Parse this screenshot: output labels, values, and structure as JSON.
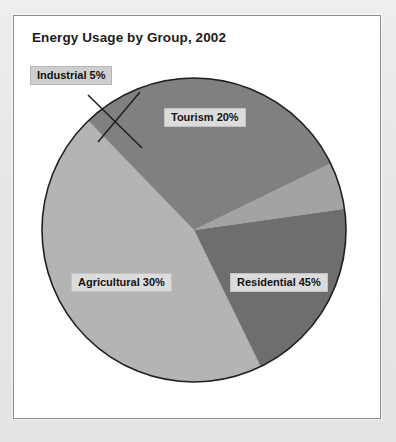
{
  "chart_data": {
    "type": "pie",
    "title": "Energy Usage by Group, 2002",
    "categories": [
      "Tourism",
      "Residential",
      "Agricultural",
      "Industrial"
    ],
    "values": [
      20,
      45,
      30,
      5
    ],
    "unit": "%",
    "labels": [
      "Tourism 20%",
      "Residential 45%",
      "Agricultural 30%",
      "Industrial 5%"
    ],
    "slice_colors": [
      "#6e6e6e",
      "#b4b4b4",
      "#808080",
      "#a3a3a3"
    ],
    "legend": "none",
    "grid": false,
    "total": 100,
    "start_angle_deg": -8,
    "direction": "clockwise",
    "outline_color": "#1f1f1f",
    "label_style": "boxed-callout",
    "external_label": "Industrial 5%"
  },
  "panel": {
    "background": "#ffffff",
    "border_color": "#8d8d8d"
  },
  "page": {
    "background": "#e7e7e7"
  }
}
